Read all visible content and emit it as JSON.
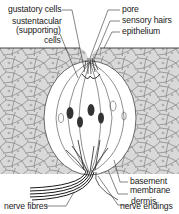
{
  "diagram": {
    "labels": {
      "gustatory_cells": "gustatory cells",
      "sustentacular_line1": "sustentacular",
      "sustentacular_line2": "(supporting)",
      "sustentacular_line3": "cells",
      "pore": "pore",
      "sensory_hairs": "sensory hairs",
      "epithelium": "epithelium",
      "basement_line1": "basement",
      "basement_line2": "membrane",
      "dermis": "dermis",
      "nerve_fibres": "nerve fibres",
      "nerve_endings": "nerve endings"
    },
    "colors": {
      "tissue_fill": "#d9d9d9",
      "cell_outline": "#6e6e6e",
      "ink": "#1a1a1a",
      "background": "#ffffff"
    }
  }
}
